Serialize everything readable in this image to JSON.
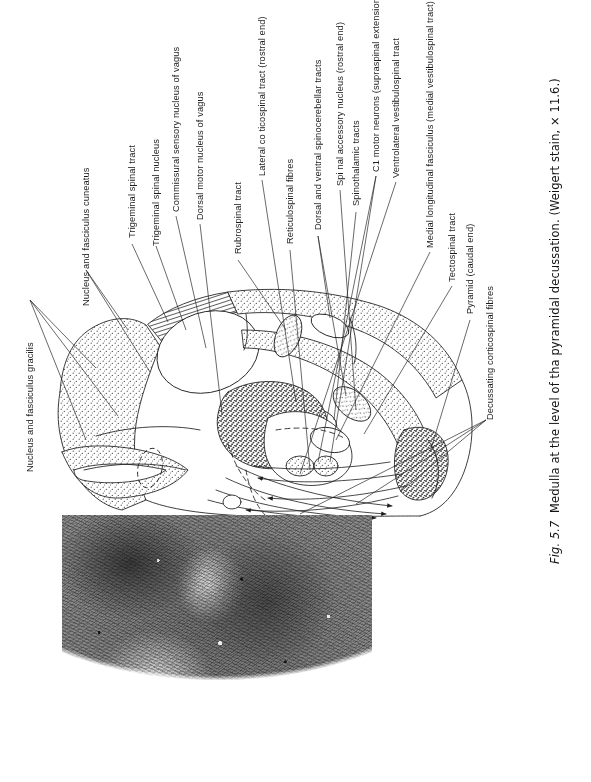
{
  "figure": {
    "caption_number": "Fig. 5.7",
    "caption_text": "Medulla at the level of tha pyramidal decussation. (Weigert stain, × 11.6.)",
    "caption_full": "Fig. 5.7  Medulla at the level of tha pyramidal decussation. (Weigert stain, × 11.6.)",
    "panels": [
      {
        "name": "line-drawing",
        "kind": "labelled-schematic"
      },
      {
        "name": "photomicrograph",
        "kind": "histology-photo-grayscale"
      }
    ]
  },
  "labels": [
    {
      "id": "nucleus-fasciculus-gracilis",
      "text": "Nucleus and fasciculus gracilis"
    },
    {
      "id": "nucleus-fasciculus-cuneatus",
      "text": "Nucleus and fasciculus cuneatus"
    },
    {
      "id": "trigeminal-spinal-tract",
      "text": "Trigeminal spinal tract"
    },
    {
      "id": "trigeminal-spinal-nucleus",
      "text": "Trigeminal spinal nucleus"
    },
    {
      "id": "commissural-sensory-nucleus-of-vagus",
      "text": "Commissural sensory nucleus of vagus"
    },
    {
      "id": "dorsal-motor-nucleus-of-vagus",
      "text": "Dorsal motor nucleus of vagus"
    },
    {
      "id": "rubrospinal-tract",
      "text": "Rubrospinal tract"
    },
    {
      "id": "lateral-corticospinal-tract",
      "text": "Lateral co ticospinal tract (rostral end)"
    },
    {
      "id": "reticulospinal-fibres",
      "text": "Reticulospinal fibres"
    },
    {
      "id": "dorsal-ventral-spinocerebellar-tracts",
      "text": "Dorsal and ventral spinocerebellar tracts"
    },
    {
      "id": "spinal-accessory-nucleus",
      "text": "Spi nal accessory nucleus (rostral end)"
    },
    {
      "id": "spinothalamic-tracts",
      "text": "Spinothalamic tracts"
    },
    {
      "id": "c1-motor-neurons",
      "text": "C1 motor neurons (supraspinal extension)"
    },
    {
      "id": "ventrolateral-vestibulospinal-tract",
      "text": "Ventrolateral vestibulospinal tract"
    },
    {
      "id": "medial-longitudinal-fasciculus",
      "text": "Medial longitudinal fasciculus (medial vestibulospinal tract)"
    },
    {
      "id": "tectospinal-tract",
      "text": "Tectospinal tract"
    },
    {
      "id": "pyramid-caudal-end",
      "text": "Pyramid (caudal end)"
    },
    {
      "id": "decussating-corticospinal-fibres",
      "text": "Decussating corticospinal fibres"
    }
  ],
  "colors": {
    "ink": "#1c1c1c",
    "paper": "#ffffff",
    "stipple": "#555555",
    "hatch": "#333333"
  }
}
